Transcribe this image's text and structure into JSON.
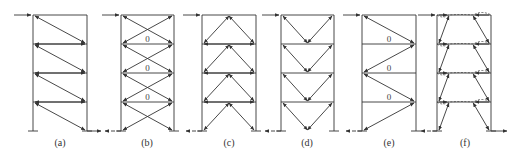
{
  "diagram": {
    "type": "braced-frame-force-flow",
    "stroke_color": "#333333",
    "floors_y": [
      15,
      44,
      73,
      102,
      131
    ],
    "frames": [
      {
        "id": "a",
        "label": "(a)",
        "left": 33,
        "right": 87,
        "bracing": "single-diagonal",
        "zero_labels": []
      },
      {
        "id": "b",
        "label": "(b)",
        "left": 121,
        "right": 174,
        "bracing": "x-braced",
        "zero_labels": [
          "0",
          "0",
          "0"
        ]
      },
      {
        "id": "c",
        "label": "(c)",
        "left": 202,
        "right": 256,
        "bracing": "inverted-v",
        "zero_labels": []
      },
      {
        "id": "d",
        "label": "(d)",
        "left": 281,
        "right": 334,
        "bracing": "v-braced",
        "zero_labels": []
      },
      {
        "id": "e",
        "label": "(e)",
        "left": 362,
        "right": 416,
        "bracing": "k-zigzag",
        "zero_labels": [
          "0",
          "0",
          "0"
        ]
      },
      {
        "id": "f",
        "label": "(f)",
        "left": 437,
        "right": 491,
        "bracing": "eccentric",
        "zero_labels": []
      }
    ]
  }
}
